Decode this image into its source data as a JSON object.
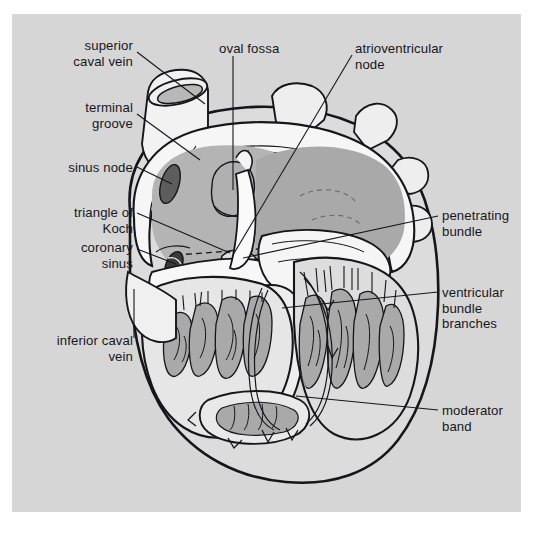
{
  "figure": {
    "domain": "anatomical-illustration",
    "panel_background": "#d6d6d6",
    "page_background": "#ffffff",
    "ink_color": "#16161a"
  },
  "palette": {
    "background": "#d6d6d6",
    "muscle_light": "#ededed",
    "chamber_mid": "#b5b5b5",
    "chamber_dark": "#a8a8a8",
    "trabecula_fill": "#a9a9a9",
    "node_dark": "#5d5d5d",
    "white_wall": "#f4f4f4",
    "outline": "#16161a"
  },
  "labels": [
    {
      "id": "superior-caval-vein",
      "text": "superior\ncaval vein",
      "align": "right",
      "x": 28,
      "y": 38,
      "w": 105,
      "leader": [
        [
          137,
          52
        ],
        [
          205,
          104
        ]
      ]
    },
    {
      "id": "terminal-groove",
      "text": "terminal\ngroove",
      "align": "right",
      "x": 28,
      "y": 100,
      "w": 105,
      "leader": [
        [
          137,
          114
        ],
        [
          200,
          160
        ]
      ]
    },
    {
      "id": "sinus-node",
      "text": "sinus node",
      "align": "right",
      "x": 18,
      "y": 160,
      "w": 115,
      "leader": [
        [
          137,
          167
        ],
        [
          172,
          184
        ]
      ]
    },
    {
      "id": "triangle-of-koch",
      "text": "triangle of\nKoch",
      "align": "right",
      "x": 28,
      "y": 205,
      "w": 105,
      "leader": [
        [
          137,
          213
        ],
        [
          230,
          253
        ]
      ]
    },
    {
      "id": "coronary-sinus",
      "text": "coronary\nsinus",
      "align": "right",
      "x": 28,
      "y": 240,
      "w": 105,
      "leader": [
        [
          137,
          249
        ],
        [
          176,
          264
        ]
      ]
    },
    {
      "id": "inferior-caval-vein",
      "text": "inferior caval\nvein",
      "align": "right",
      "x": 18,
      "y": 333,
      "w": 115,
      "leader": [
        [
          134,
          338
        ],
        [
          134,
          289
        ]
      ]
    },
    {
      "id": "oval-fossa",
      "text": "oval fossa",
      "align": "left",
      "x": 219,
      "y": 41,
      "w": 96,
      "leader": [
        [
          233,
          56
        ],
        [
          233,
          190
        ]
      ]
    },
    {
      "id": "atrioventricular-node",
      "text": "atrioventricular\nnode",
      "align": "left",
      "x": 355,
      "y": 41,
      "w": 130,
      "leader": [
        [
          352,
          55
        ],
        [
          233,
          255
        ]
      ]
    },
    {
      "id": "penetrating-bundle",
      "text": "penetrating\nbundle",
      "align": "left",
      "x": 442,
      "y": 208,
      "w": 92,
      "leader": [
        [
          438,
          216
        ],
        [
          243,
          258
        ]
      ]
    },
    {
      "id": "ventricular-bundle-branches",
      "text": "ventricular\nbundle\nbranches",
      "align": "left",
      "x": 442,
      "y": 285,
      "w": 92,
      "leader": [
        [
          438,
          292
        ],
        [
          282,
          308
        ]
      ]
    },
    {
      "id": "moderator-band",
      "text": "moderator\nband",
      "align": "left",
      "x": 442,
      "y": 403,
      "w": 92,
      "leader": [
        [
          438,
          410
        ],
        [
          296,
          396
        ]
      ]
    }
  ]
}
